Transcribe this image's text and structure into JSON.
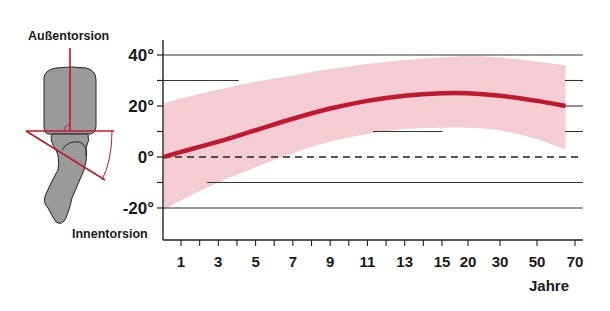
{
  "chart_data": {
    "type": "line",
    "title": "",
    "xlabel": "Jahre",
    "ylabel": "",
    "y_top_label": "Außentorsion",
    "y_bottom_label": "Innentorsion",
    "ylim": [
      -25,
      45
    ],
    "y_ticks_major": [
      40,
      20,
      0,
      -20
    ],
    "y_tick_labels": [
      "40°",
      "20°",
      "0°",
      "-20°"
    ],
    "y_ticks_minor": [
      30,
      10,
      -10
    ],
    "x_scale": "categorical-age",
    "x_ticks": [
      1,
      2,
      3,
      4,
      5,
      6,
      7,
      8,
      9,
      10,
      11,
      12,
      13,
      14,
      15,
      20,
      30,
      50,
      70
    ],
    "x_tick_labels": [
      "1",
      "3",
      "5",
      "7",
      "9",
      "11",
      "13",
      "15",
      "20",
      "30",
      "50",
      "70"
    ],
    "x_tick_label_values": [
      1,
      3,
      5,
      7,
      9,
      11,
      13,
      15,
      20,
      30,
      50,
      70
    ],
    "reference_line": {
      "y": 0,
      "style": "dashed"
    },
    "series": [
      {
        "name": "Mittelwert",
        "color": "#c0182f",
        "x": [
          0.1,
          1,
          3,
          5,
          7,
          9,
          11,
          13,
          15,
          20,
          30,
          50,
          65
        ],
        "y": [
          0,
          2,
          6,
          10.5,
          15,
          19,
          22,
          24,
          25,
          25,
          24,
          22,
          20
        ]
      }
    ],
    "band": {
      "name": "Normbereich",
      "color": "#f2c7cf",
      "x": [
        0.1,
        1,
        3,
        5,
        7,
        9,
        11,
        13,
        15,
        20,
        30,
        50,
        65
      ],
      "upper": [
        21,
        23,
        26.5,
        29.5,
        32,
        34.5,
        36.5,
        38,
        39,
        39.5,
        39,
        37.5,
        36
      ],
      "lower": [
        -21,
        -17,
        -10,
        -4,
        1.5,
        6,
        9,
        11,
        11.5,
        11.5,
        10.5,
        7,
        3
      ]
    },
    "grid_lines": [
      {
        "y": 40,
        "from": 0.1,
        "to": 70
      },
      {
        "y": 30,
        "from": 0.1,
        "to": 4.1
      },
      {
        "y": 30,
        "from": 70,
        "to": 70
      },
      {
        "y": 20,
        "from": 70,
        "to": 70
      },
      {
        "y": 10,
        "from": 11.3,
        "to": 15.1
      },
      {
        "y": 10,
        "from": 70,
        "to": 70
      },
      {
        "y": -10,
        "from": 2.4,
        "to": 70
      },
      {
        "y": -20,
        "from": 0.1,
        "to": 70
      }
    ],
    "grid": true,
    "legend": "none"
  },
  "illustration": {
    "name": "foot-torsion-diagram",
    "description": "Unterschenkel mit Fuß, Torsionswinkel"
  }
}
